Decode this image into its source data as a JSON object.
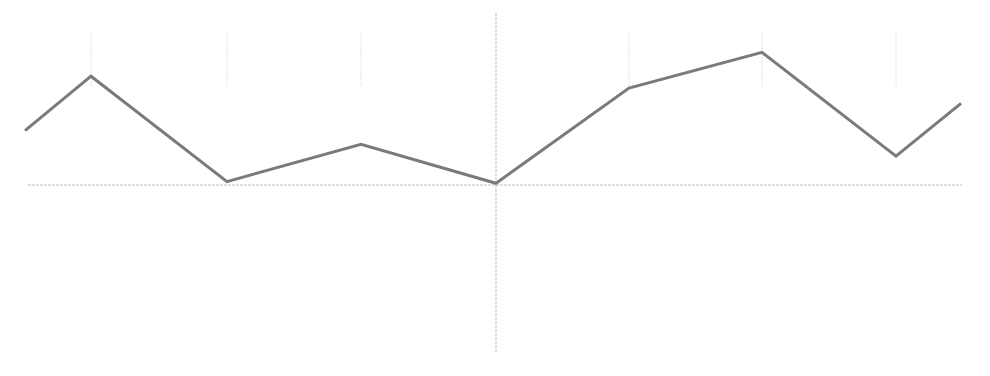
{
  "chart_data": {
    "type": "line",
    "title": "",
    "xlabel": "",
    "ylabel": "",
    "grid": true,
    "legend": null,
    "x": [
      0,
      1,
      2,
      3,
      4,
      5,
      6,
      7,
      8
    ],
    "series": [
      {
        "name": "series-1",
        "values": [
          0.32,
          0.64,
          0.02,
          0.24,
          0.01,
          0.57,
          0.78,
          0.17,
          0.48
        ]
      }
    ],
    "ylim": [
      -1,
      1
    ],
    "note": "No axis tick labels are legible; values are normalized heights relative to the x-axis baseline (0) with the central vertical axis spanning roughly -1 to 1."
  },
  "style": {
    "line_color": "#7a7a7a",
    "line_width": 3,
    "axis_color": "#bdbdbd",
    "grid_color": "#e2e2e2",
    "background": "#ffffff"
  },
  "layout": {
    "baseline_y": 185,
    "unit_px": 170,
    "x_px": [
      25,
      91,
      227,
      361,
      496,
      629,
      762,
      896,
      961
    ],
    "axis_x_start": 28,
    "axis_x_end": 962,
    "vaxis_x": 496,
    "vaxis_top": 13,
    "vaxis_bottom": 353,
    "gridlines_x": [
      91,
      227,
      361,
      629,
      762,
      896
    ],
    "gridline_top": 33,
    "gridline_bottom": 86
  }
}
